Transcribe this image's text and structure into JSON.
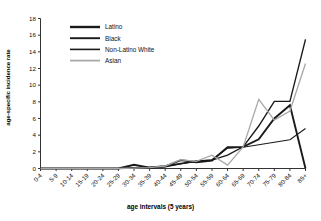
{
  "chart_data": {
    "type": "line",
    "title": "",
    "xlabel": "age intervals (5 years)",
    "ylabel": "age-specific incidence rate",
    "categories": [
      "0-4",
      "5-9",
      "10-14",
      "15-19",
      "20-24",
      "25-29",
      "30-34",
      "35-39",
      "40-44",
      "45-49",
      "50-54",
      "55-59",
      "60-64",
      "65-69",
      "70-74",
      "75-79",
      "80-84",
      "85+"
    ],
    "ylim": [
      0,
      18
    ],
    "yticks": [
      0,
      2,
      4,
      6,
      8,
      10,
      12,
      14,
      16,
      18
    ],
    "grid": false,
    "legend_position": "top-left-inside",
    "series": [
      {
        "name": "Latino",
        "color": "#1a1a1a",
        "width": 1.9,
        "values": [
          0,
          0,
          0,
          0,
          0,
          0,
          0.45,
          0.1,
          0.25,
          1.0,
          0.75,
          0.95,
          2.55,
          2.6,
          3.5,
          6.0,
          7.6,
          0
        ]
      },
      {
        "name": "Black",
        "color": "#1a1a1a",
        "width": 1.4,
        "values": [
          0,
          0,
          0,
          0,
          0,
          0,
          0.1,
          0.15,
          0.3,
          0.6,
          0.9,
          1.0,
          1.6,
          2.6,
          5.1,
          8.05,
          8.05,
          15.5
        ]
      },
      {
        "name": "Non-Latino White",
        "color": "#1a1a1a",
        "width": 1.1,
        "values": [
          0,
          0,
          0,
          0,
          0,
          0,
          0.1,
          0.1,
          0.2,
          0.55,
          0.85,
          1.05,
          2.45,
          2.55,
          2.85,
          3.15,
          3.45,
          4.8
        ]
      },
      {
        "name": "Asian",
        "color": "#a8a8a8",
        "width": 1.3,
        "values": [
          0,
          0,
          0,
          0,
          0,
          0,
          0.05,
          0.1,
          0.3,
          1.05,
          0.85,
          1.6,
          0.4,
          2.6,
          8.3,
          5.8,
          6.9,
          12.6
        ]
      }
    ]
  },
  "axis": {
    "y_tick_labels": [
      "0",
      "2",
      "4",
      "6",
      "8",
      "10",
      "12",
      "14",
      "16",
      "18"
    ],
    "x_tick_labels": [
      "0-4",
      "5-9",
      "10-14",
      "15-19",
      "20-24",
      "25-29",
      "30-34",
      "35-39",
      "40-44",
      "45-49",
      "50-54",
      "55-59",
      "60-64",
      "65-69",
      "70-74",
      "75-79",
      "80-84",
      "85+"
    ]
  },
  "legend": {
    "entries": [
      {
        "label": "Latino"
      },
      {
        "label": "Black"
      },
      {
        "label": "Non-Latino White"
      },
      {
        "label": "Asian"
      }
    ]
  }
}
